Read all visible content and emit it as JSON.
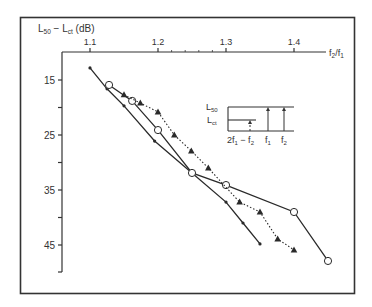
{
  "chart_data": {
    "type": "line",
    "title": "",
    "xlabel": "f2/f1",
    "ylabel": "L50 - Lct (dB)",
    "x_axis_position": "top",
    "y_axis_inverted": true,
    "xlim": [
      1.1,
      1.45
    ],
    "ylim": [
      10,
      50
    ],
    "x_ticks": [
      1.1,
      1.2,
      1.3,
      1.4
    ],
    "x_tick_labels": [
      "1.1",
      "1.2",
      "1.3",
      "1.4"
    ],
    "y_ticks": [
      15,
      25,
      35,
      45
    ],
    "y_tick_labels": [
      "15",
      "25",
      "35",
      "45"
    ],
    "y_minor_ticks": [
      20,
      30,
      40,
      50
    ],
    "grid": false,
    "series": [
      {
        "name": "small-dot series (solid line)",
        "marker": "dot",
        "line": "solid",
        "x": [
          1.1,
          1.125,
          1.15,
          1.195,
          1.25,
          1.3,
          1.325,
          1.35
        ],
        "y": [
          12.8,
          16.6,
          19.7,
          26.1,
          31.9,
          37.2,
          41.0,
          44.8
        ]
      },
      {
        "name": "open-circle series (solid line)",
        "marker": "open-circle",
        "line": "solid",
        "x": [
          1.128,
          1.162,
          1.2,
          1.25,
          1.3,
          1.4,
          1.45
        ],
        "y": [
          15.9,
          18.8,
          24.1,
          31.9,
          34.1,
          39.0,
          47.9
        ]
      },
      {
        "name": "triangle series (dotted line)",
        "marker": "filled-triangle",
        "line": "dotted",
        "x": [
          1.15,
          1.174,
          1.2,
          1.224,
          1.249,
          1.274,
          1.32,
          1.35,
          1.376,
          1.4
        ],
        "y": [
          17.7,
          19.2,
          20.8,
          25.0,
          27.9,
          31.0,
          37.2,
          39.0,
          43.9,
          45.9
        ]
      }
    ],
    "annotations": [
      {
        "type": "inset-diagram",
        "labels": [
          "L50",
          "Lct",
          "2f1 − f2",
          "f1",
          "f2"
        ]
      }
    ]
  },
  "labels": {
    "y_axis_title_main": "L",
    "y_axis_title_sub1": "50",
    "y_axis_title_mid": " − L",
    "y_axis_title_sub2": "ct",
    "y_axis_title_unit": " (dB)",
    "x_axis_title_f2": "f",
    "x_axis_title_sub2": "2",
    "x_axis_title_slash": "/f",
    "x_axis_title_sub1": "1",
    "inset_L": "L",
    "inset_50": "50",
    "inset_ct": "ct",
    "inset_2f1": "2f",
    "inset_2f1_sub": "1",
    "inset_minus_f2": " − f",
    "inset_minus_f2_sub": "2",
    "inset_f1": "f",
    "inset_f1_sub": "1",
    "inset_f2": "f",
    "inset_f2_sub": "2"
  },
  "colors": {
    "ink": "#2a2a2a",
    "frame": "#333333",
    "background": "#ffffff"
  }
}
